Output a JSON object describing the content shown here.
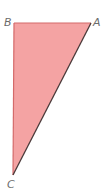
{
  "diagram": {
    "type": "right-triangle",
    "fill_color": "#f4a3a3",
    "edge_color": "#d46a6a",
    "hypotenuse_color": "#4a3a3a",
    "label_color": "#6b6b6b",
    "vertices": {
      "A": {
        "label": "A",
        "x": 91,
        "y": 23
      },
      "B": {
        "label": "B",
        "x": 14,
        "y": 23
      },
      "C": {
        "label": "C",
        "x": 13,
        "y": 175
      }
    }
  }
}
